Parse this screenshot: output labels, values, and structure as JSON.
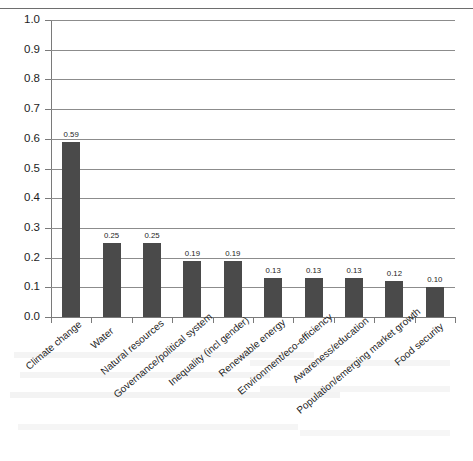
{
  "chart_data": {
    "type": "bar",
    "title": "",
    "subtitle": "",
    "xlabel": "",
    "ylabel": "",
    "ylim": [
      0.0,
      1.0
    ],
    "grid": true,
    "legend": false,
    "orientation": "vertical",
    "bar_color": "#4a4a4a",
    "gridline_color": "#8c8c8c",
    "axis_color": "#7a7a7a",
    "text_color": "#1d1d1d",
    "ytick_labels": [
      "1.0",
      "0.9",
      "0.8",
      "0.7",
      "0.6",
      "0.5",
      "0.4",
      "0.3",
      "0.2",
      "0.1",
      "0.0"
    ],
    "ytick_values": [
      1.0,
      0.9,
      0.8,
      0.7,
      0.6,
      0.5,
      0.4,
      0.3,
      0.2,
      0.1,
      0.0
    ],
    "categories": [
      "Climate change",
      "Water",
      "Natural resources",
      "Governance/political system",
      "Inequality (incl gender)",
      "Renewable energy",
      "Environment/eco-efficiency",
      "Awareness/education",
      "Population/emerging market growth",
      "Food security"
    ],
    "values": [
      0.59,
      0.25,
      0.25,
      0.19,
      0.19,
      0.13,
      0.13,
      0.13,
      0.12,
      0.1
    ],
    "data_labels": [
      "0.59",
      "0.25",
      "0.25",
      "0.19",
      "0.19",
      "0.13",
      "0.13",
      "0.13",
      "0.12",
      "0.10"
    ]
  }
}
